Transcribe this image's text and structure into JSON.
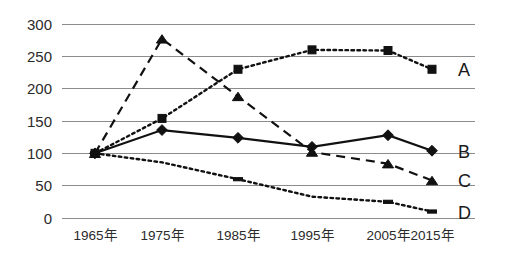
{
  "chart_data": {
    "type": "line",
    "title": "",
    "subtitle": "",
    "xlabel": "",
    "ylabel": "",
    "categories": [
      "1965年",
      "1975年",
      "1985年",
      "1995年",
      "2005年",
      "2015年"
    ],
    "x": [
      1965,
      1975,
      1985,
      1995,
      2005,
      2015
    ],
    "ylim": [
      0,
      300
    ],
    "xlim_index": [
      0,
      5
    ],
    "y_ticks": [
      0,
      50,
      100,
      150,
      200,
      250,
      300
    ],
    "y_tick_labels": [
      "0",
      "50",
      "100",
      "150",
      "200",
      "250",
      "300"
    ],
    "grid": "horizontal",
    "legend_position": "right-inline-end-of-line",
    "series": [
      {
        "name": "A",
        "label": "A",
        "line_style": "dotted",
        "marker": "square",
        "color": "#111111",
        "values": [
          100,
          154,
          230,
          260,
          259,
          230
        ]
      },
      {
        "name": "B",
        "label": "B",
        "line_style": "solid",
        "marker": "diamond",
        "color": "#111111",
        "values": [
          100,
          136,
          124,
          110,
          128,
          104
        ]
      },
      {
        "name": "C",
        "label": "C",
        "line_style": "dashed",
        "marker": "triangle",
        "color": "#111111",
        "values": [
          100,
          277,
          188,
          102,
          84,
          58
        ]
      },
      {
        "name": "D",
        "label": "D",
        "line_style": "dotted",
        "marker": "dash",
        "color": "#111111",
        "values": [
          100,
          86,
          60,
          33,
          25,
          10
        ]
      }
    ],
    "annotations": []
  },
  "axes": {
    "y_axis_name": "value-axis",
    "x_axis_name": "year-axis"
  }
}
